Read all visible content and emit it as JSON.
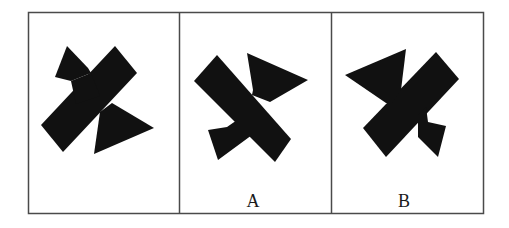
{
  "figure": {
    "colors": {
      "background": "#ffffff",
      "frame": "#4a4a4a",
      "shape_fill": "#111111",
      "label": "#1a1a1a"
    },
    "panels": [
      {
        "id": "reference",
        "label": "",
        "shape": "pinwheel-x-shape-original"
      },
      {
        "id": "option-a",
        "label": "A",
        "shape": "pinwheel-x-shape-variant-a"
      },
      {
        "id": "option-b",
        "label": "B",
        "shape": "pinwheel-x-shape-variant-b"
      }
    ]
  }
}
